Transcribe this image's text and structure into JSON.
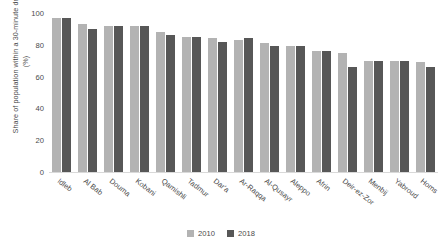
{
  "chart_data": {
    "type": "bar",
    "title": "",
    "subtitle": "",
    "xlabel": "",
    "ylabel": "Share of population within a 30-minute drive (%)",
    "ylim": [
      0,
      100
    ],
    "ytick_values": [
      100,
      80,
      60,
      40,
      20,
      0
    ],
    "ytick_labels": [
      "100",
      "80",
      "60",
      "40",
      "20",
      "0"
    ],
    "grid": false,
    "legend_position": "bottom-center",
    "categories": [
      "Idleb",
      "Al Bab",
      "Douma",
      "Kobani",
      "Qamishli",
      "Tadmur",
      "Dar'a",
      "Ar-Raqqa",
      "Al-Qusayr",
      "Aleppo",
      "Afrin",
      "Deir-ez-Zor",
      "Menbij",
      "Yabroud",
      "Homs"
    ],
    "series": [
      {
        "name": "2010",
        "color": "#b3b3b3",
        "values": [
          97,
          93,
          92,
          92,
          88,
          85,
          84,
          83,
          81,
          79,
          76,
          75,
          70,
          70,
          69
        ]
      },
      {
        "name": "2018",
        "color": "#575757",
        "values": [
          97,
          90,
          92,
          92,
          86,
          85,
          82,
          84,
          79,
          79,
          76,
          66,
          70,
          70,
          66
        ]
      }
    ]
  },
  "axis": {
    "y_title": "Share of population within a 30-minute drive (%)"
  },
  "legend": {
    "items": [
      {
        "label": "2010",
        "color": "#b3b3b3"
      },
      {
        "label": "2018",
        "color": "#575757"
      }
    ]
  },
  "colors": {
    "series_2010": "#b3b3b3",
    "series_2018": "#575757",
    "axis_line": "#d9d9d9",
    "text": "#4a4a4a",
    "background": "#ffffff"
  }
}
